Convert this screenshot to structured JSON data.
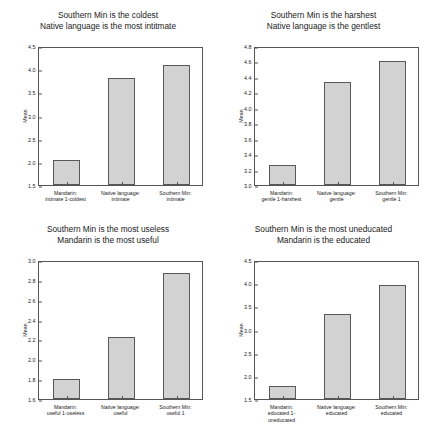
{
  "figure": {
    "background_color": "#ffffff",
    "bar_fill_color": "#d2d2d2",
    "bar_edge_color": "#585858",
    "axis_color": "#555555",
    "panel_count": 4
  },
  "chart_data": [
    {
      "type": "bar",
      "panel_index": 0,
      "title": "Southern Min is the coldest\nNative language is the most intitmate",
      "title_lines": [
        "Southern Min is the coldest",
        "Native language is the most intitmate"
      ],
      "categories": [
        "Mandarin: intimate 1-coldest",
        "Native language: intimate",
        "Southern Min: intimate"
      ],
      "category_lines": [
        [
          "Mandarin:",
          "intimate 1-coldest"
        ],
        [
          "Native language:",
          "intimate"
        ],
        [
          "Southern Min:",
          "intimate"
        ]
      ],
      "values": [
        2.03,
        3.81,
        4.1
      ],
      "xlabel": "",
      "ylabel": "Mean",
      "ylim": [
        1.5,
        4.5
      ],
      "yticks": [
        "1.5",
        "2.0",
        "2.5",
        "3.0",
        "3.5",
        "4.0",
        "4.5"
      ],
      "ytick_values": [
        1.5,
        2.0,
        2.5,
        3.0,
        3.5,
        4.0,
        4.5
      ],
      "grid": false,
      "legend": false
    },
    {
      "type": "bar",
      "panel_index": 1,
      "title": "Southern Min is the harshest\nNative language is the gentlest",
      "title_lines": [
        "Southern Min is the harshest",
        "Native language is the gentlest"
      ],
      "categories": [
        "Mandarin: gentle 1-harshest",
        "Native language: gentle",
        "Southern Min: gentle 1"
      ],
      "category_lines": [
        [
          "Mandarin:",
          "gentle 1-harshest"
        ],
        [
          "Native language:",
          "gentle"
        ],
        [
          "Southern Min:",
          "gentle 1"
        ]
      ],
      "values": [
        3.26,
        4.34,
        4.6
      ],
      "xlabel": "",
      "ylabel": "Mean",
      "ylim": [
        3.0,
        4.8
      ],
      "yticks": [
        "3.0",
        "3.2",
        "3.4",
        "3.6",
        "3.8",
        "4.0",
        "4.2",
        "4.4",
        "4.6",
        "4.8"
      ],
      "ytick_values": [
        3.0,
        3.2,
        3.4,
        3.6,
        3.8,
        4.0,
        4.2,
        4.4,
        4.6,
        4.8
      ],
      "grid": false,
      "legend": false
    },
    {
      "type": "bar",
      "panel_index": 2,
      "title": "Southern Min is the most useless\nMandarin is the most useful",
      "title_lines": [
        "Southern Min is the most useless",
        "Mandarin is the most useful"
      ],
      "categories": [
        "Mandarin: useful 1-useless",
        "Native language: useful",
        "Southern Min: useful 1"
      ],
      "category_lines": [
        [
          "Mandarin:",
          "useful 1-useless"
        ],
        [
          "Native language:",
          "useful"
        ],
        [
          "Southern Min:",
          "useful 1"
        ]
      ],
      "values": [
        1.8,
        2.22,
        2.87
      ],
      "xlabel": "",
      "ylabel": "Mean",
      "ylim": [
        1.6,
        3.0
      ],
      "yticks": [
        "1.6",
        "1.8",
        "2.0",
        "2.2",
        "2.4",
        "2.6",
        "2.8",
        "3.0"
      ],
      "ytick_values": [
        1.6,
        1.8,
        2.0,
        2.2,
        2.4,
        2.6,
        2.8,
        3.0
      ],
      "grid": false,
      "legend": false
    },
    {
      "type": "bar",
      "panel_index": 3,
      "title": "Southern Min is the most uneducated\nMandarin is the educated",
      "title_lines": [
        "Southern Min is the most uneducated",
        "Mandarin is the educated"
      ],
      "categories": [
        "Mandarin: educated 1-uneducated",
        "Native language: educated",
        "Southern Min: educated"
      ],
      "category_lines": [
        [
          "Mandarin:",
          "educated 1-",
          "uneducated"
        ],
        [
          "Native language:",
          "educated"
        ],
        [
          "Southern Min:",
          "educated"
        ]
      ],
      "values": [
        1.79,
        3.33,
        3.95
      ],
      "xlabel": "",
      "ylabel": "Mean",
      "ylim": [
        1.5,
        4.5
      ],
      "yticks": [
        "1.5",
        "2.0",
        "2.5",
        "3.0",
        "3.5",
        "4.0",
        "4.5"
      ],
      "ytick_values": [
        1.5,
        2.0,
        2.5,
        3.0,
        3.5,
        4.0,
        4.5
      ],
      "grid": false,
      "legend": false
    }
  ]
}
